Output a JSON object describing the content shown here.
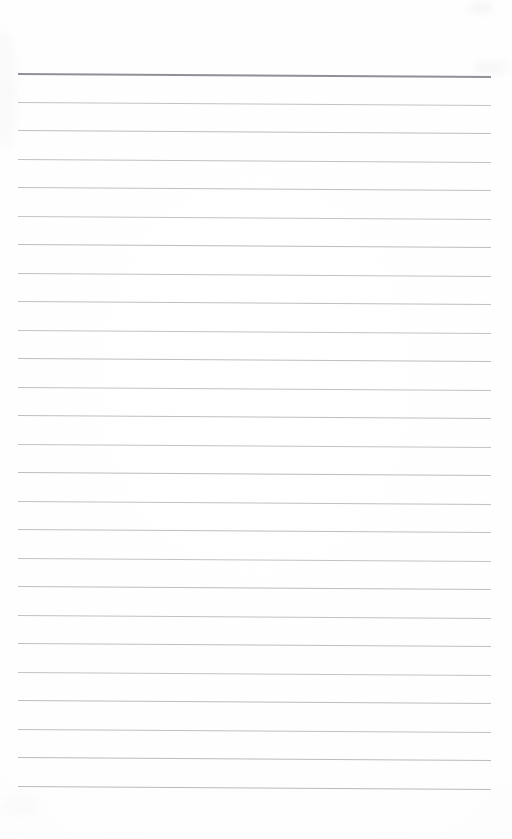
{
  "document": {
    "kind": "scanned-page",
    "type": "blank lined notepad page",
    "page_width": 512,
    "page_height": 839,
    "background_color": "#fefefe",
    "paper_tone": "#ffffff",
    "text_content": "",
    "handwriting_present": false,
    "printed_text_present": false,
    "page_number": "",
    "header_text": "",
    "footer_text": ""
  },
  "ruling": {
    "line_count": 26,
    "first_line_y": 73,
    "line_spacing": 28.5,
    "line_start_x": 18,
    "line_end_x": 491,
    "skew_drop_px": 3,
    "body_line_color": "#b9b9bd",
    "body_line_width": 1,
    "header_line_color": "#8a8a92",
    "header_line_width": 2,
    "header_line_index": 0,
    "lines": [
      {
        "index": 1,
        "y": 73,
        "color": "#8a8a92",
        "width": 2,
        "role": "header-rule"
      },
      {
        "index": 2,
        "y": 101.5,
        "color": "#bcbcc0",
        "width": 1,
        "role": "body-rule"
      },
      {
        "index": 3,
        "y": 130,
        "color": "#b7b7bc",
        "width": 1,
        "role": "body-rule"
      },
      {
        "index": 4,
        "y": 158.5,
        "color": "#bababe",
        "width": 1,
        "role": "body-rule"
      },
      {
        "index": 5,
        "y": 187,
        "color": "#b8b8bd",
        "width": 1,
        "role": "body-rule"
      },
      {
        "index": 6,
        "y": 215.5,
        "color": "#bcbcc0",
        "width": 1,
        "role": "body-rule"
      },
      {
        "index": 7,
        "y": 244,
        "color": "#b6b6bb",
        "width": 1,
        "role": "body-rule"
      },
      {
        "index": 8,
        "y": 272.5,
        "color": "#bababe",
        "width": 1,
        "role": "body-rule"
      },
      {
        "index": 9,
        "y": 301,
        "color": "#b8b8bd",
        "width": 1,
        "role": "body-rule"
      },
      {
        "index": 10,
        "y": 329.5,
        "color": "#bdbdc1",
        "width": 1,
        "role": "body-rule"
      },
      {
        "index": 11,
        "y": 358,
        "color": "#b7b7bc",
        "width": 1,
        "role": "body-rule"
      },
      {
        "index": 12,
        "y": 386.5,
        "color": "#bababe",
        "width": 1,
        "role": "body-rule"
      },
      {
        "index": 13,
        "y": 415,
        "color": "#b8b8bd",
        "width": 1,
        "role": "body-rule"
      },
      {
        "index": 14,
        "y": 443.5,
        "color": "#bcbcc0",
        "width": 1,
        "role": "body-rule"
      },
      {
        "index": 15,
        "y": 472,
        "color": "#b6b6bb",
        "width": 1,
        "role": "body-rule"
      },
      {
        "index": 16,
        "y": 500.5,
        "color": "#bababe",
        "width": 1,
        "role": "body-rule"
      },
      {
        "index": 17,
        "y": 529,
        "color": "#b8b8bd",
        "width": 1,
        "role": "body-rule"
      },
      {
        "index": 18,
        "y": 557.5,
        "color": "#bdbdc1",
        "width": 1,
        "role": "body-rule"
      },
      {
        "index": 19,
        "y": 586,
        "color": "#b7b7bc",
        "width": 1,
        "role": "body-rule"
      },
      {
        "index": 20,
        "y": 614.5,
        "color": "#bababe",
        "width": 1,
        "role": "body-rule"
      },
      {
        "index": 21,
        "y": 643,
        "color": "#b8b8bd",
        "width": 1,
        "role": "body-rule"
      },
      {
        "index": 22,
        "y": 671.5,
        "color": "#bcbcc0",
        "width": 1,
        "role": "body-rule"
      },
      {
        "index": 23,
        "y": 700,
        "color": "#b6b6bb",
        "width": 1,
        "role": "body-rule"
      },
      {
        "index": 24,
        "y": 728.5,
        "color": "#bababe",
        "width": 1,
        "role": "body-rule"
      },
      {
        "index": 25,
        "y": 757,
        "color": "#b4b4b9",
        "width": 1.2,
        "role": "body-rule"
      },
      {
        "index": 26,
        "y": 785.5,
        "color": "#b2b2b7",
        "width": 1.2,
        "role": "body-rule"
      }
    ]
  },
  "margins": {
    "top_blank_height": 73,
    "bottom_blank_height": 53,
    "left_blank_width": 18,
    "right_blank_width": 21
  }
}
